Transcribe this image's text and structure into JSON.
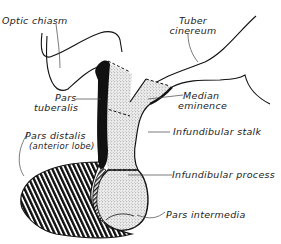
{
  "diagram": {
    "colors": {
      "ink": "#111111",
      "background": "#ffffff",
      "stipple": "#d9d9d9"
    },
    "labels": {
      "optic_chiasm": "Optic chiasm",
      "tuber_cinereum_1": "Tuber",
      "tuber_cinereum_2": "cinereum",
      "pars_tuberalis_1": "Pars",
      "pars_tuberalis_2": "tuberalis",
      "median_eminence_1": "Median",
      "median_eminence_2": "eminence",
      "infundibular_stalk": "Infundibular stalk",
      "pars_distalis": "Pars distalis",
      "pars_distalis_sub": "(anterior lobe)",
      "infundibular_process": "Infundibular process",
      "pars_intermedia": "Pars intermedia"
    },
    "regions": [
      {
        "name": "Optic chiasm",
        "fill": "outline"
      },
      {
        "name": "Tuber cinereum",
        "fill": "outline"
      },
      {
        "name": "Pars tuberalis",
        "fill": "solid black"
      },
      {
        "name": "Median eminence",
        "fill": "stipple"
      },
      {
        "name": "Infundibular stalk",
        "fill": "stipple"
      },
      {
        "name": "Infundibular process",
        "fill": "stipple"
      },
      {
        "name": "Pars distalis (anterior lobe)",
        "fill": "diagonal hatching"
      },
      {
        "name": "Pars intermedia",
        "fill": "fine hatching"
      }
    ]
  }
}
